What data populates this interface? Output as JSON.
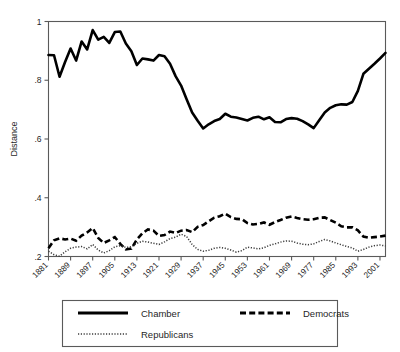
{
  "chart_data": {
    "type": "line",
    "title": "",
    "xlabel": "",
    "ylabel": "Distance",
    "grid": false,
    "legend_position": "bottom",
    "xlim": [
      1881,
      2003
    ],
    "ylim": [
      0.2,
      1.0
    ],
    "ytick_labels": [
      "1",
      ".8",
      ".6",
      ".4",
      ".2"
    ],
    "ytick_values": [
      1,
      0.8,
      0.6,
      0.4,
      0.2
    ],
    "xtick_labels": [
      "1881",
      "1889",
      "1897",
      "1905",
      "1913",
      "1921",
      "1929",
      "1937",
      "1945",
      "1953",
      "1961",
      "1969",
      "1977",
      "1985",
      "1993",
      "2001"
    ],
    "xtick_values": [
      1881,
      1889,
      1897,
      1905,
      1913,
      1921,
      1929,
      1937,
      1945,
      1953,
      1961,
      1969,
      1977,
      1985,
      1993,
      2001
    ],
    "x": [
      1881,
      1883,
      1885,
      1887,
      1889,
      1891,
      1893,
      1895,
      1897,
      1899,
      1901,
      1903,
      1905,
      1907,
      1909,
      1911,
      1913,
      1915,
      1917,
      1919,
      1921,
      1923,
      1925,
      1927,
      1929,
      1931,
      1933,
      1935,
      1937,
      1939,
      1941,
      1943,
      1945,
      1947,
      1949,
      1951,
      1953,
      1955,
      1957,
      1959,
      1961,
      1963,
      1965,
      1967,
      1969,
      1971,
      1973,
      1975,
      1977,
      1979,
      1981,
      1983,
      1985,
      1987,
      1989,
      1991,
      1993,
      1995,
      1997,
      1999,
      2001,
      2003
    ],
    "series": [
      {
        "name": "Chamber",
        "style": "solid",
        "color": "#000000",
        "values": [
          0.886,
          0.885,
          0.812,
          0.862,
          0.908,
          0.867,
          0.932,
          0.905,
          0.971,
          0.938,
          0.948,
          0.927,
          0.964,
          0.966,
          0.925,
          0.899,
          0.852,
          0.874,
          0.871,
          0.867,
          0.886,
          0.882,
          0.856,
          0.814,
          0.782,
          0.735,
          0.69,
          0.662,
          0.636,
          0.65,
          0.661,
          0.668,
          0.686,
          0.676,
          0.673,
          0.668,
          0.663,
          0.672,
          0.676,
          0.667,
          0.674,
          0.658,
          0.657,
          0.668,
          0.671,
          0.669,
          0.661,
          0.65,
          0.637,
          0.664,
          0.69,
          0.706,
          0.715,
          0.718,
          0.717,
          0.726,
          0.764,
          0.822,
          0.839,
          0.856,
          0.874,
          0.893
        ]
      },
      {
        "name": "Democrats",
        "style": "dashed",
        "color": "#000000",
        "values": [
          0.228,
          0.255,
          0.262,
          0.258,
          0.261,
          0.254,
          0.271,
          0.282,
          0.297,
          0.263,
          0.246,
          0.255,
          0.266,
          0.243,
          0.224,
          0.227,
          0.258,
          0.279,
          0.292,
          0.288,
          0.27,
          0.273,
          0.285,
          0.28,
          0.288,
          0.29,
          0.283,
          0.301,
          0.307,
          0.32,
          0.332,
          0.337,
          0.346,
          0.334,
          0.328,
          0.327,
          0.314,
          0.309,
          0.311,
          0.316,
          0.308,
          0.317,
          0.324,
          0.332,
          0.336,
          0.331,
          0.327,
          0.325,
          0.327,
          0.332,
          0.333,
          0.324,
          0.315,
          0.303,
          0.299,
          0.299,
          0.289,
          0.268,
          0.264,
          0.266,
          0.268,
          0.271
        ]
      },
      {
        "name": "Republicans",
        "style": "dotted",
        "color": "#3d3d3d",
        "values": [
          0.218,
          0.206,
          0.201,
          0.216,
          0.228,
          0.232,
          0.234,
          0.226,
          0.241,
          0.222,
          0.212,
          0.22,
          0.233,
          0.237,
          0.231,
          0.233,
          0.245,
          0.252,
          0.249,
          0.245,
          0.241,
          0.25,
          0.261,
          0.266,
          0.276,
          0.268,
          0.241,
          0.224,
          0.218,
          0.221,
          0.228,
          0.231,
          0.228,
          0.222,
          0.215,
          0.22,
          0.232,
          0.229,
          0.226,
          0.23,
          0.238,
          0.243,
          0.249,
          0.253,
          0.252,
          0.246,
          0.242,
          0.24,
          0.243,
          0.251,
          0.258,
          0.253,
          0.246,
          0.24,
          0.234,
          0.229,
          0.218,
          0.224,
          0.232,
          0.237,
          0.239,
          0.236
        ]
      }
    ]
  },
  "legend": {
    "items": [
      {
        "label": "Chamber",
        "style": "solid"
      },
      {
        "label": "Democrats",
        "style": "dashed"
      },
      {
        "label": "Republicans",
        "style": "dotted"
      }
    ]
  }
}
